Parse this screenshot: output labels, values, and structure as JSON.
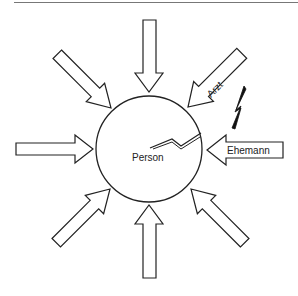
{
  "diagram": {
    "center_label": "Person",
    "labeled_arrows": [
      {
        "label": "Arzt",
        "direction": "from-top-right"
      },
      {
        "label": "Ehemann",
        "direction": "from-right"
      }
    ],
    "unlabeled_arrows": [
      "from-top",
      "from-top-left",
      "from-left",
      "from-bottom-left",
      "from-bottom",
      "from-bottom-right"
    ],
    "colors": {
      "stroke": "#222222",
      "background": "#ffffff",
      "bolt": "#111111"
    }
  }
}
